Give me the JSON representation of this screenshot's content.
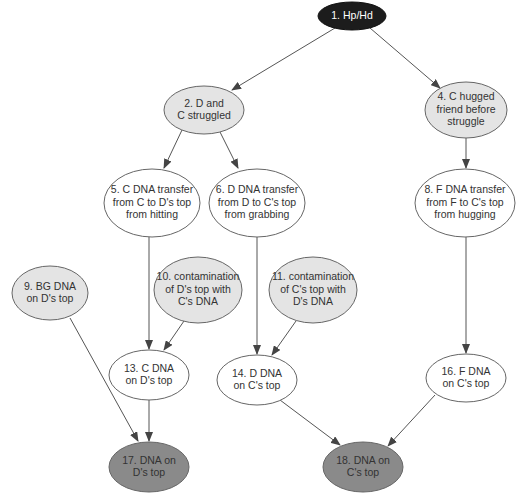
{
  "colors": {
    "hypothesis_fill": "#1c1c1c",
    "hypothesis_text": "#ffffff",
    "activity_fill": "#e4e4e4",
    "transfer_fill": "#ffffff",
    "outcome_fill": "#8a8a8a",
    "outline": "#666666",
    "text": "#333333",
    "edge": "#555555"
  },
  "nodes": [
    {
      "id": "1",
      "lines": [
        "1. Hp/Hd"
      ],
      "cx": 352,
      "cy": 16,
      "rx": 34,
      "ry": 14,
      "type": "hypothesis"
    },
    {
      "id": "2",
      "lines": [
        "2. D and",
        "C struggled"
      ],
      "cx": 204,
      "cy": 110,
      "rx": 40,
      "ry": 24,
      "type": "activity"
    },
    {
      "id": "4",
      "lines": [
        "4. C hugged",
        "friend before",
        "struggle"
      ],
      "cx": 466,
      "cy": 110,
      "rx": 41,
      "ry": 28,
      "type": "activity"
    },
    {
      "id": "5",
      "lines": [
        "5. C DNA transfer",
        "from C to D's top",
        "from hitting"
      ],
      "cx": 152,
      "cy": 203,
      "rx": 48,
      "ry": 34,
      "type": "transfer"
    },
    {
      "id": "6",
      "lines": [
        "6. D DNA transfer",
        "from D to C's top",
        "from grabbing"
      ],
      "cx": 257,
      "cy": 203,
      "rx": 48,
      "ry": 34,
      "type": "transfer"
    },
    {
      "id": "8",
      "lines": [
        "8. F DNA transfer",
        "from F to C's top",
        "from hugging"
      ],
      "cx": 465,
      "cy": 203,
      "rx": 50,
      "ry": 34,
      "type": "transfer"
    },
    {
      "id": "9",
      "lines": [
        "9. BG DNA",
        "on D's top"
      ],
      "cx": 50,
      "cy": 293,
      "rx": 38,
      "ry": 27,
      "type": "activity"
    },
    {
      "id": "10",
      "lines": [
        "10. contamination",
        "of D's top with",
        "C's DNA"
      ],
      "cx": 198,
      "cy": 290,
      "rx": 44,
      "ry": 33,
      "type": "activity"
    },
    {
      "id": "11",
      "lines": [
        "11. contamination",
        "of C's top with",
        "D's DNA"
      ],
      "cx": 313,
      "cy": 290,
      "rx": 44,
      "ry": 33,
      "type": "activity"
    },
    {
      "id": "13",
      "lines": [
        "13. C DNA",
        "on D's top"
      ],
      "cx": 149,
      "cy": 375,
      "rx": 40,
      "ry": 25,
      "type": "transfer"
    },
    {
      "id": "14",
      "lines": [
        "14. D DNA",
        "on C's top"
      ],
      "cx": 257,
      "cy": 380,
      "rx": 40,
      "ry": 25,
      "type": "transfer"
    },
    {
      "id": "16",
      "lines": [
        "16. F DNA",
        "on C's top"
      ],
      "cx": 466,
      "cy": 378,
      "rx": 40,
      "ry": 24,
      "type": "transfer"
    },
    {
      "id": "17",
      "lines": [
        "17. DNA on",
        "D's top"
      ],
      "cx": 149,
      "cy": 467,
      "rx": 40,
      "ry": 25,
      "type": "outcome"
    },
    {
      "id": "18",
      "lines": [
        "18. DNA on",
        "C's top"
      ],
      "cx": 363,
      "cy": 467,
      "rx": 40,
      "ry": 25,
      "type": "outcome"
    }
  ],
  "edges": [
    {
      "from": "1",
      "to": "2"
    },
    {
      "from": "1",
      "to": "4"
    },
    {
      "from": "2",
      "to": "5"
    },
    {
      "from": "2",
      "to": "6"
    },
    {
      "from": "4",
      "to": "8"
    },
    {
      "from": "5",
      "to": "13"
    },
    {
      "from": "10",
      "to": "13"
    },
    {
      "from": "6",
      "to": "14"
    },
    {
      "from": "11",
      "to": "14"
    },
    {
      "from": "8",
      "to": "16"
    },
    {
      "from": "9",
      "to": "17"
    },
    {
      "from": "13",
      "to": "17"
    },
    {
      "from": "14",
      "to": "18"
    },
    {
      "from": "16",
      "to": "18"
    }
  ],
  "edge_paths": [
    {
      "x1": 335,
      "y1": 28,
      "x2": 232,
      "y2": 90
    },
    {
      "x1": 370,
      "y1": 28,
      "x2": 440,
      "y2": 88
    },
    {
      "x1": 182,
      "y1": 130,
      "x2": 164,
      "y2": 168
    },
    {
      "x1": 220,
      "y1": 132,
      "x2": 238,
      "y2": 168
    },
    {
      "x1": 466,
      "y1": 138,
      "x2": 466,
      "y2": 168
    },
    {
      "x1": 149,
      "y1": 237,
      "x2": 149,
      "y2": 349
    },
    {
      "x1": 184,
      "y1": 321,
      "x2": 164,
      "y2": 350
    },
    {
      "x1": 257,
      "y1": 237,
      "x2": 257,
      "y2": 354
    },
    {
      "x1": 296,
      "y1": 321,
      "x2": 272,
      "y2": 355
    },
    {
      "x1": 466,
      "y1": 237,
      "x2": 466,
      "y2": 353
    },
    {
      "x1": 70,
      "y1": 318,
      "x2": 138,
      "y2": 441
    },
    {
      "x1": 149,
      "y1": 400,
      "x2": 149,
      "y2": 441
    },
    {
      "x1": 280,
      "y1": 400,
      "x2": 340,
      "y2": 445
    },
    {
      "x1": 435,
      "y1": 395,
      "x2": 388,
      "y2": 446
    }
  ]
}
